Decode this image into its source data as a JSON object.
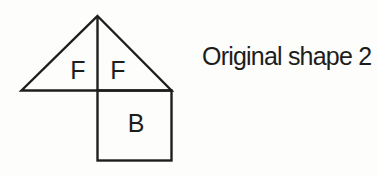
{
  "figure": {
    "caption": "Original shape 2",
    "shape": {
      "description": "Composite shape: an isosceles triangle split vertically into two halves sitting on top of a square",
      "labels": {
        "left_triangle": "F",
        "right_triangle": "F",
        "square": "B"
      }
    }
  },
  "colors": {
    "background": "#fdfdfc",
    "line": "#1e1e1e",
    "ink": "#1d1d1b"
  }
}
